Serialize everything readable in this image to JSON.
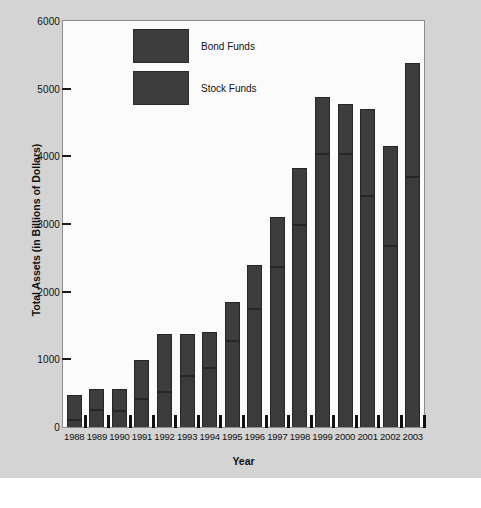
{
  "chart_data": {
    "type": "bar",
    "subtype": "stacked-bar",
    "title": "",
    "xlabel": "Year",
    "ylabel": "Total Assets (in Billions of Dollars)",
    "ylim": [
      0,
      6000
    ],
    "ytick_step": 1000,
    "yticks": [
      "0",
      "1000",
      "2000",
      "3000",
      "4000",
      "5000",
      "6000"
    ],
    "grid": false,
    "legend_position": "upper-left-inside",
    "categories": [
      "1988",
      "1989",
      "1990",
      "1991",
      "1992",
      "1993",
      "1994",
      "1995",
      "1996",
      "1997",
      "1998",
      "1999",
      "2000",
      "2001",
      "2002",
      "2003"
    ],
    "series": [
      {
        "name": "Stock Funds",
        "color": "#3b3b3b",
        "values": [
          100,
          250,
          240,
          410,
          520,
          750,
          870,
          1270,
          1750,
          2370,
          2980,
          4040,
          4030,
          3420,
          2670,
          3690
        ]
      },
      {
        "name": "Bond Funds",
        "color": "#3d3d3d",
        "values": [
          370,
          310,
          320,
          580,
          860,
          620,
          530,
          580,
          640,
          740,
          850,
          840,
          750,
          1280,
          1480,
          1690
        ]
      }
    ],
    "totals": [
      470,
      560,
      560,
      990,
      1380,
      1370,
      1400,
      1850,
      2390,
      3110,
      3830,
      4880,
      4780,
      4700,
      4150,
      5380
    ]
  },
  "legend": {
    "items": [
      {
        "label": "Bond Funds",
        "swatch_color": "#3d3d3d"
      },
      {
        "label": "Stock Funds",
        "swatch_color": "#3d3d3d"
      }
    ]
  },
  "axes": {
    "y_title": "Total Assets (in Billions of Dollars)",
    "x_title": "Year"
  },
  "colors": {
    "figure_background": "#d4d4d4",
    "plot_background": "#fbfbfb",
    "plot_border": "#8d8d8d",
    "bar_fill": "#3b3b3b",
    "bar_edge": "#262626",
    "text": "#111111"
  },
  "ghost_text": {
    "line1": "Mutual Fund Performance",
    "line2": "Mutual Fund Performance"
  }
}
